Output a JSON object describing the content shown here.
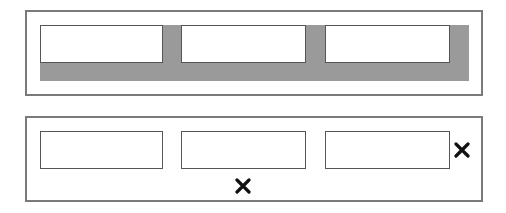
{
  "diagram": {
    "top_panel": {
      "description": "Three boxes over a shaded gray region",
      "boxes": [
        "box-1",
        "box-2",
        "box-3"
      ],
      "shade_color": "#9a9a9a"
    },
    "bottom_panel": {
      "description": "Three boxes with two X marks",
      "boxes": [
        "box-1",
        "box-2",
        "box-3"
      ],
      "marks": [
        "x-mark-below-middle",
        "x-mark-right-of-last"
      ]
    },
    "colors": {
      "border": "#7a7a7a",
      "box_border": "#555555",
      "mark": "#111111"
    }
  }
}
